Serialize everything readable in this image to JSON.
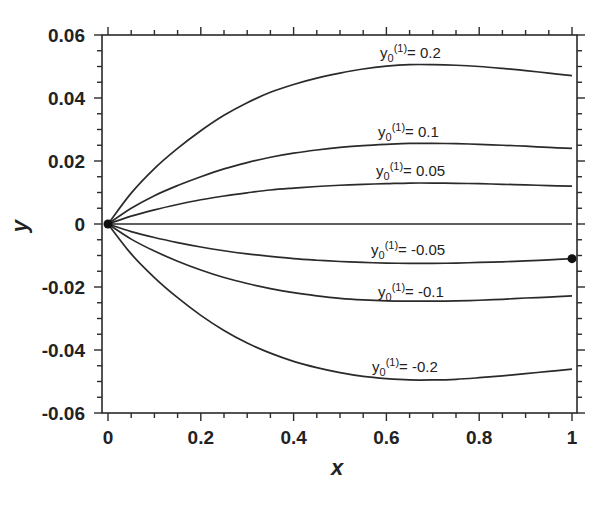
{
  "chart_data": {
    "type": "line",
    "title": "",
    "xlabel": "x",
    "ylabel": "y",
    "xlim": [
      0,
      1
    ],
    "ylim": [
      -0.06,
      0.06
    ],
    "grid": false,
    "legend": "inline curve labels",
    "x_ticks": [
      "0",
      "0.2",
      "0.4",
      "0.6",
      "0.8",
      "1"
    ],
    "y_ticks": [
      "0.06",
      "0.04",
      "0.02",
      "0",
      "-0.02",
      "-0.04",
      "-0.06"
    ],
    "x": [
      0,
      0.05,
      0.1,
      0.15,
      0.2,
      0.25,
      0.3,
      0.35,
      0.4,
      0.45,
      0.5,
      0.55,
      0.6,
      0.65,
      0.7,
      0.75,
      0.8,
      0.85,
      0.9,
      0.95,
      1.0
    ],
    "series": [
      {
        "name": "y0(1)= 0.2",
        "label_text": "= 0.2",
        "values": [
          0,
          0.0098,
          0.0176,
          0.024,
          0.0296,
          0.0345,
          0.0385,
          0.0418,
          0.0443,
          0.0463,
          0.0479,
          0.0492,
          0.0501,
          0.0506,
          0.0506,
          0.0504,
          0.05,
          0.0494,
          0.0487,
          0.0479,
          0.0471
        ]
      },
      {
        "name": "y0(1)= 0.1",
        "label_text": "= 0.1",
        "values": [
          0,
          0.005,
          0.009,
          0.0122,
          0.015,
          0.0175,
          0.0195,
          0.0212,
          0.0225,
          0.0235,
          0.0243,
          0.0249,
          0.0253,
          0.0256,
          0.0256,
          0.0255,
          0.0253,
          0.025,
          0.0247,
          0.0243,
          0.024
        ]
      },
      {
        "name": "y0(1)= 0.05",
        "label_text": "= 0.05",
        "values": [
          0,
          0.0025,
          0.0045,
          0.0062,
          0.0077,
          0.0089,
          0.0099,
          0.0108,
          0.0114,
          0.0119,
          0.0123,
          0.0126,
          0.0128,
          0.013,
          0.013,
          0.0129,
          0.0128,
          0.0126,
          0.0124,
          0.0122,
          0.012
        ]
      },
      {
        "name": "y0(1)= 0",
        "label_text": "",
        "values": [
          0,
          0,
          0,
          0,
          0,
          0,
          0,
          0,
          0,
          0,
          0,
          0,
          0,
          0,
          0,
          0,
          0,
          0,
          0,
          0,
          0
        ]
      },
      {
        "name": "y0(1)= -0.05",
        "label_text": "= -0.05",
        "values": [
          0,
          -0.0024,
          -0.0043,
          -0.0059,
          -0.0073,
          -0.0085,
          -0.0095,
          -0.0103,
          -0.011,
          -0.0115,
          -0.0119,
          -0.0122,
          -0.0124,
          -0.0125,
          -0.0125,
          -0.0124,
          -0.0122,
          -0.012,
          -0.0117,
          -0.0114,
          -0.011
        ]
      },
      {
        "name": "y0(1)= -0.1",
        "label_text": "= -0.1",
        "values": [
          0,
          -0.0048,
          -0.0086,
          -0.0118,
          -0.0146,
          -0.017,
          -0.0189,
          -0.0205,
          -0.0218,
          -0.0228,
          -0.0236,
          -0.0241,
          -0.0244,
          -0.0245,
          -0.0245,
          -0.0244,
          -0.0242,
          -0.0239,
          -0.0235,
          -0.0232,
          -0.0228
        ]
      },
      {
        "name": "y0(1)= -0.2",
        "label_text": "= -0.2",
        "values": [
          0,
          -0.0095,
          -0.017,
          -0.0234,
          -0.029,
          -0.0338,
          -0.0378,
          -0.041,
          -0.0436,
          -0.0456,
          -0.0472,
          -0.0484,
          -0.0491,
          -0.0495,
          -0.0495,
          -0.0493,
          -0.0488,
          -0.0482,
          -0.0475,
          -0.0468,
          -0.0461
        ]
      }
    ],
    "markers": [
      {
        "x": 0,
        "y": 0,
        "shape": "filled-circle"
      },
      {
        "x": 1,
        "y": -0.011,
        "shape": "filled-circle"
      }
    ],
    "label_positions": [
      {
        "series": 0,
        "px": 380,
        "py": 58
      },
      {
        "series": 1,
        "px": 378,
        "py": 137
      },
      {
        "series": 2,
        "px": 376,
        "py": 176
      },
      {
        "series": 4,
        "px": 371,
        "py": 255
      },
      {
        "series": 5,
        "px": 378,
        "py": 297
      },
      {
        "series": 6,
        "px": 372,
        "py": 372
      }
    ]
  },
  "colors": {
    "line": "#2a2a2a",
    "axis": "#2a2a2a",
    "background": "#ffffff"
  }
}
